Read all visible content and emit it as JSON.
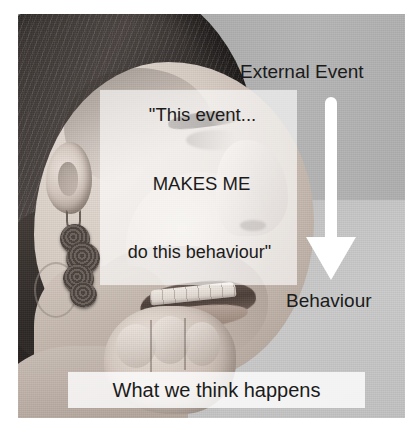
{
  "slide": {
    "background_color": "#ffffff",
    "photo": {
      "description": "black-and-white photograph of a woman in profile biting her nails",
      "backdrop_color": "#b0b0b0",
      "light_zone_color": "#c8c8c8"
    }
  },
  "labels": {
    "external_event": "External Event",
    "behaviour": "Behaviour"
  },
  "quote": {
    "line1": "\"This event...",
    "line2": "MAKES ME",
    "line3": "do this behaviour\"",
    "panel_color": "#ffffff"
  },
  "arrow": {
    "name": "down-arrow",
    "direction": "down",
    "color": "#ffffff"
  },
  "caption": {
    "text": "What we think happens",
    "bar_color": "#ffffff"
  },
  "text_color": "#1b1b1b"
}
